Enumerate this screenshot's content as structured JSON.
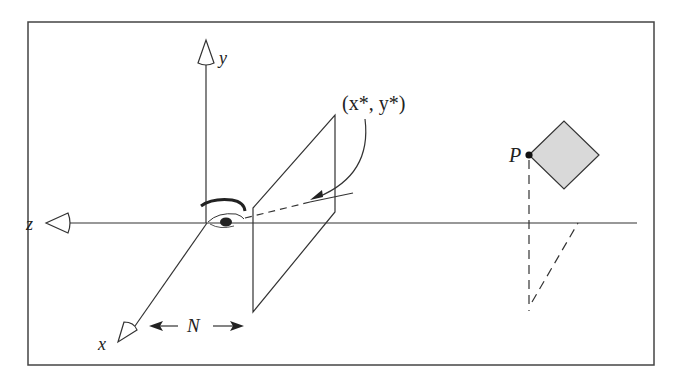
{
  "diagram": {
    "colors": {
      "line": "#333333",
      "frame": "#444444",
      "fill_diamond": "#d9d9d9",
      "background": "#ffffff"
    },
    "axes": {
      "x_label": "x",
      "y_label": "y",
      "z_label": "z"
    },
    "labels": {
      "projected_point": "(x*, y*)",
      "point": "P",
      "distance": "N"
    }
  }
}
